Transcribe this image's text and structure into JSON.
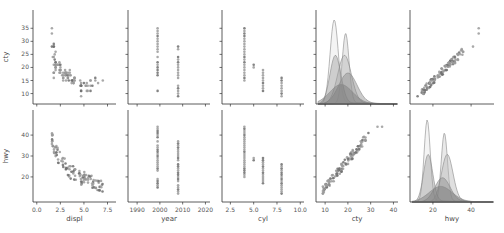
{
  "chart_data": {
    "type": "pairplot",
    "title": "",
    "variables": [
      "displ",
      "year",
      "cyl",
      "cty",
      "hwy"
    ],
    "rows": [
      "cty",
      "hwy"
    ],
    "columns": [
      "displ",
      "year",
      "cyl",
      "cty",
      "hwy"
    ],
    "grid": false,
    "legend": null,
    "diagonal_kind": "kde (stacked multiple overlapping distributions, semi-transparent gray fills)",
    "marker_color": "#808080",
    "kde_fill_colors": [
      "#e6e6e6",
      "#cfcfcf",
      "#b8b8b8",
      "#a0a0a0",
      "#8a8a8a"
    ],
    "axes": {
      "displ": {
        "label": "displ",
        "ticks": [
          0.0,
          2.5,
          5.0,
          7.5
        ],
        "tick_labels": [
          "0.0",
          "2.5",
          "5.0",
          "7.5"
        ],
        "range": [
          -0.4,
          8.4
        ]
      },
      "year": {
        "label": "year",
        "ticks": [
          1990,
          2000,
          2010,
          2020
        ],
        "tick_labels": [
          "1990",
          "2000",
          "2010",
          "2020"
        ],
        "range": [
          1986,
          2022
        ]
      },
      "cyl": {
        "label": "cyl",
        "ticks": [
          2.5,
          5.0,
          7.5,
          10.0
        ],
        "tick_labels": [
          "2.5",
          "5.0",
          "7.5",
          "10.0"
        ],
        "range": [
          1.6,
          10.4
        ]
      },
      "cty": {
        "label": "cty",
        "ticks": [
          10,
          20,
          30,
          40
        ],
        "tick_labels": [
          "10",
          "20",
          "30",
          "40"
        ],
        "y_ticks": [
          10,
          15,
          20,
          25,
          30,
          35
        ],
        "y_tick_labels": [
          "10",
          "15",
          "20",
          "25",
          "30",
          "35"
        ],
        "range": [
          6,
          42
        ]
      },
      "hwy": {
        "label": "hwy",
        "ticks": [
          20,
          40
        ],
        "tick_labels": [
          "20",
          "40"
        ],
        "y_ticks": [
          20,
          30,
          40
        ],
        "y_tick_labels": [
          "20",
          "30",
          "40"
        ],
        "range": [
          8,
          52
        ]
      }
    },
    "panels": [
      {
        "row": "cty",
        "col": "displ",
        "kind": "scatter",
        "trend": "negative, curved",
        "points": [
          [
            1.8,
            18
          ],
          [
            1.8,
            21
          ],
          [
            2.0,
            20
          ],
          [
            2.0,
            21
          ],
          [
            2.8,
            16
          ],
          [
            2.8,
            18
          ],
          [
            3.1,
            18
          ],
          [
            1.8,
            18
          ],
          [
            1.8,
            16
          ],
          [
            2.0,
            20
          ],
          [
            2.0,
            19
          ],
          [
            2.8,
            15
          ],
          [
            2.8,
            17
          ],
          [
            3.1,
            17
          ],
          [
            3.1,
            15
          ],
          [
            5.7,
            15
          ],
          [
            5.7,
            15
          ],
          [
            6.2,
            16
          ],
          [
            6.2,
            15
          ],
          [
            7.0,
            15
          ],
          [
            5.3,
            14
          ],
          [
            5.3,
            11
          ],
          [
            5.7,
            11
          ],
          [
            6.5,
            14
          ],
          [
            2.4,
            19
          ],
          [
            2.4,
            22
          ],
          [
            3.1,
            18
          ],
          [
            3.5,
            18
          ],
          [
            3.6,
            17
          ],
          [
            2.4,
            18
          ],
          [
            3.0,
            17
          ],
          [
            3.3,
            16
          ],
          [
            3.3,
            16
          ],
          [
            3.3,
            17
          ],
          [
            3.8,
            15
          ],
          [
            3.8,
            15
          ],
          [
            4.0,
            15
          ],
          [
            3.7,
            15
          ],
          [
            3.7,
            14
          ],
          [
            3.9,
            14
          ],
          [
            3.9,
            14
          ],
          [
            4.7,
            14
          ],
          [
            4.7,
            11
          ],
          [
            4.7,
            11
          ],
          [
            5.2,
            13
          ],
          [
            5.2,
            13
          ],
          [
            5.7,
            13
          ],
          [
            5.9,
            13
          ],
          [
            4.7,
            13
          ],
          [
            4.7,
            13
          ],
          [
            4.7,
            9
          ],
          [
            4.7,
            13
          ],
          [
            4.6,
            13
          ],
          [
            5.4,
            11
          ],
          [
            5.4,
            13
          ],
          [
            1.8,
            28
          ],
          [
            1.8,
            24
          ],
          [
            1.6,
            28
          ],
          [
            1.6,
            33
          ],
          [
            1.6,
            35
          ],
          [
            1.8,
            29
          ],
          [
            1.7,
            24
          ],
          [
            2.0,
            21
          ],
          [
            2.5,
            19
          ],
          [
            2.5,
            18
          ],
          [
            2.2,
            21
          ],
          [
            2.4,
            21
          ],
          [
            3.0,
            18
          ],
          [
            3.0,
            19
          ],
          [
            3.5,
            19
          ],
          [
            2.2,
            21
          ],
          [
            2.4,
            21
          ],
          [
            3.0,
            18
          ],
          [
            3.5,
            17
          ],
          [
            3.3,
            18
          ],
          [
            4.0,
            16
          ],
          [
            4.0,
            16
          ],
          [
            4.6,
            15
          ],
          [
            5.0,
            14
          ],
          [
            2.0,
            22
          ],
          [
            2.5,
            20
          ],
          [
            2.7,
            17
          ],
          [
            3.4,
            15
          ],
          [
            4.0,
            15
          ],
          [
            4.7,
            13
          ],
          [
            1.9,
            25
          ],
          [
            1.9,
            23
          ],
          [
            2.0,
            22
          ],
          [
            2.8,
            16
          ],
          [
            2.5,
            21
          ],
          [
            2.5,
            19
          ],
          [
            1.8,
            28
          ],
          [
            2.0,
            26
          ]
        ]
      },
      {
        "row": "cty",
        "col": "year",
        "kind": "scatter",
        "x_values": [
          1999,
          2008
        ],
        "y_range_1999": [
          11,
          35
        ],
        "y_range_2008": [
          9,
          28
        ]
      },
      {
        "row": "cty",
        "col": "cyl",
        "kind": "scatter",
        "x_values": [
          4,
          5,
          6,
          8
        ],
        "y_range_by_x": {
          "4": [
            15,
            35
          ],
          "5": [
            20,
            21
          ],
          "6": [
            11,
            19
          ],
          "8": [
            9,
            16
          ]
        }
      },
      {
        "row": "cty",
        "col": "cty",
        "kind": "kde",
        "x_range": [
          6,
          40
        ],
        "peaks": [
          14,
          19
        ]
      },
      {
        "row": "cty",
        "col": "hwy",
        "kind": "scatter",
        "trend": "strong positive linear",
        "x_range": [
          12,
          44
        ],
        "y_range": [
          9,
          35
        ]
      },
      {
        "row": "hwy",
        "col": "displ",
        "kind": "scatter",
        "trend": "negative, curved",
        "x_range": [
          1.6,
          7.0
        ],
        "y_range": [
          12,
          44
        ]
      },
      {
        "row": "hwy",
        "col": "year",
        "kind": "scatter",
        "x_values": [
          1999,
          2008
        ],
        "y_range_1999": [
          15,
          44
        ],
        "y_range_2008": [
          12,
          37
        ]
      },
      {
        "row": "hwy",
        "col": "cyl",
        "kind": "scatter",
        "x_values": [
          4,
          5,
          6,
          8
        ],
        "y_range_by_x": {
          "4": [
            20,
            44
          ],
          "5": [
            28,
            29
          ],
          "6": [
            17,
            29
          ],
          "8": [
            12,
            26
          ]
        }
      },
      {
        "row": "hwy",
        "col": "cty",
        "kind": "scatter",
        "trend": "strong positive linear",
        "x_range": [
          9,
          35
        ],
        "y_range": [
          12,
          44
        ]
      },
      {
        "row": "hwy",
        "col": "hwy",
        "kind": "kde",
        "x_range": [
          10,
          48
        ],
        "peaks": [
          17,
          26
        ]
      }
    ]
  }
}
